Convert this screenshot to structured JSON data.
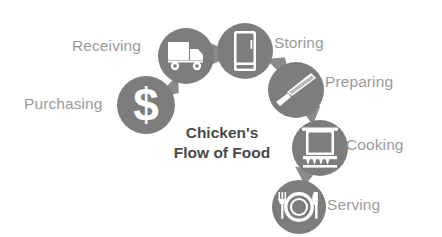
{
  "diagram": {
    "title_line1": "Chicken's",
    "title_line2": "Flow of Food",
    "background_color": "#ffffff",
    "circle_color": "#7d7d7d",
    "icon_color": "#ffffff",
    "label_color": "#9b9b9b",
    "title_color": "#4a4a4a",
    "arrow_color": "#8a8a8a",
    "steps": [
      {
        "id": "purchasing",
        "label": "Purchasing",
        "icon": "dollar-sign-icon",
        "order": 1,
        "cx": 146,
        "cy": 105,
        "r": 29,
        "label_x": 24,
        "label_y": 98,
        "label_side": "left"
      },
      {
        "id": "receiving",
        "label": "Receiving",
        "icon": "delivery-truck-icon",
        "order": 2,
        "cx": 186,
        "cy": 56,
        "r": 28,
        "label_x": 72,
        "label_y": 40,
        "label_side": "left"
      },
      {
        "id": "storing",
        "label": "Storing",
        "icon": "refrigerator-icon",
        "order": 3,
        "cx": 245,
        "cy": 51,
        "r": 28,
        "label_x": 274,
        "label_y": 36,
        "label_side": "right"
      },
      {
        "id": "preparing",
        "label": "Preparing",
        "icon": "chef-knife-icon",
        "order": 4,
        "cx": 296,
        "cy": 90,
        "r": 28,
        "label_x": 325,
        "label_y": 76,
        "label_side": "right"
      },
      {
        "id": "cooking",
        "label": "Cooking",
        "icon": "cooking-pot-icon",
        "order": 5,
        "cx": 320,
        "cy": 148,
        "r": 28,
        "label_x": 345,
        "label_y": 138,
        "label_side": "right"
      },
      {
        "id": "serving",
        "label": "Serving",
        "icon": "plate-cutlery-icon",
        "order": 6,
        "cx": 299,
        "cy": 207,
        "r": 27,
        "label_x": 327,
        "label_y": 198,
        "label_side": "right"
      }
    ],
    "arrows": [
      {
        "from": "purchasing",
        "to": "receiving",
        "name": "arrow-purchasing-to-receiving"
      },
      {
        "from": "receiving",
        "to": "storing",
        "name": "arrow-receiving-to-storing"
      },
      {
        "from": "storing",
        "to": "preparing",
        "name": "arrow-storing-to-preparing"
      },
      {
        "from": "preparing",
        "to": "cooking",
        "name": "arrow-preparing-to-cooking"
      },
      {
        "from": "cooking",
        "to": "serving",
        "name": "arrow-cooking-to-serving"
      }
    ]
  }
}
